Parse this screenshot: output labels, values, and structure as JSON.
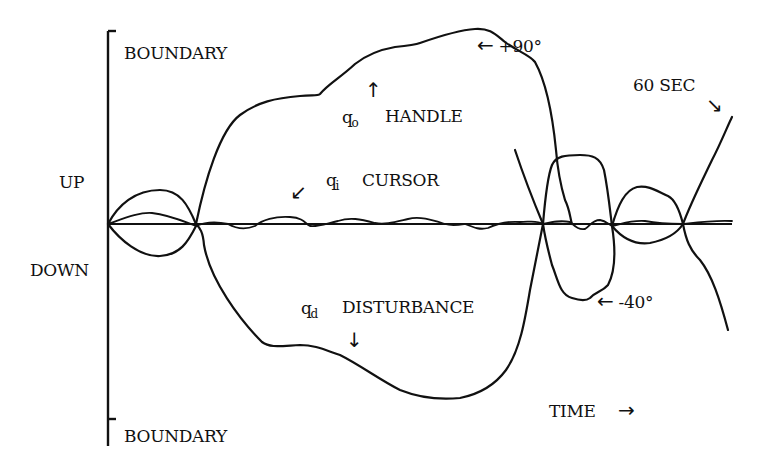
{
  "diagram": {
    "title": "",
    "y_axis": {
      "top_label": "BOUNDARY",
      "bottom_label": "BOUNDARY",
      "up_label": "UP",
      "down_label": "DOWN"
    },
    "x_axis": {
      "label": "TIME",
      "arrow": "→",
      "end_label": "60 SEC",
      "end_arrow": "↘"
    },
    "annotations": {
      "max_angle": "+90°",
      "max_angle_arrow": "←",
      "min_angle": "-40°",
      "min_angle_arrow": "←"
    },
    "traces": [
      {
        "symbol": "q",
        "subscript": "o",
        "name": "HANDLE",
        "arrow": "↑"
      },
      {
        "symbol": "q",
        "subscript": "i",
        "name": "CURSOR",
        "arrow": "↙"
      },
      {
        "symbol": "q",
        "subscript": "d",
        "name": "DISTURBANCE",
        "arrow": "↓"
      }
    ],
    "colors": {
      "ink": "#111111",
      "background": "#ffffff"
    }
  }
}
